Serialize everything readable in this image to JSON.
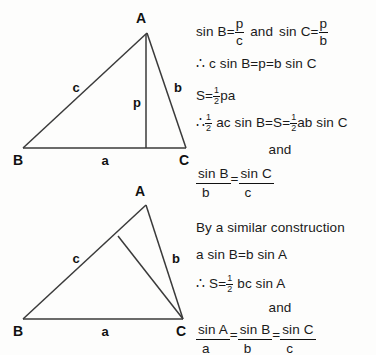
{
  "figures": [
    {
      "name": "triangle-with-altitude",
      "vertices": {
        "A": "A",
        "B": "B",
        "C": "C"
      },
      "side_labels": {
        "c": "c",
        "b": "b",
        "a": "a",
        "p": "p"
      }
    },
    {
      "name": "triangle-with-cevian",
      "vertices": {
        "A": "A",
        "B": "B",
        "C": "C"
      },
      "side_labels": {
        "c": "c",
        "b": "b",
        "a": "a"
      }
    }
  ],
  "derivation": {
    "line1": {
      "sin": "sin",
      "B": "B",
      "eq": "=",
      "p1": "p",
      "c": "c",
      "and": "and",
      "sin2": "sin",
      "C": "C",
      "eq2": "=",
      "p2": "p",
      "b": "b"
    },
    "line2": {
      "therefore": "∴",
      "text": "c sin B=p=b sin C"
    },
    "line3": {
      "S": "S",
      "eq": "=",
      "num": "1",
      "den": "2",
      "tail": "pa"
    },
    "line4": {
      "therefore": "∴",
      "num": "1",
      "den": "2",
      "mid": "ac sin B=S=",
      "num2": "1",
      "den2": "2",
      "tail": "ab sin C"
    },
    "line5": {
      "and": "and"
    },
    "line6": {
      "numB": "sin B",
      "denB": "b",
      "eq": "=",
      "numC": "sin C",
      "denC": "c"
    },
    "line7": {
      "text": "By a similar construction"
    },
    "line8": {
      "text": "a sin B=b sin A"
    },
    "line9": {
      "therefore": "∴",
      "S": "S",
      "eq": "=",
      "num": "1",
      "den": "2",
      "tail": "bc sin A"
    },
    "line10": {
      "and": "and"
    },
    "line11": {
      "numA": "sin A",
      "denA": "a",
      "eq1": "=",
      "numB": "sin B",
      "denB": "b",
      "eq2": "=",
      "numC": "sin C",
      "denC": "c"
    }
  },
  "colors": {
    "ink": "#1a1a1a",
    "background": "#fdfdfc",
    "stroke": "#3a3a3a"
  }
}
